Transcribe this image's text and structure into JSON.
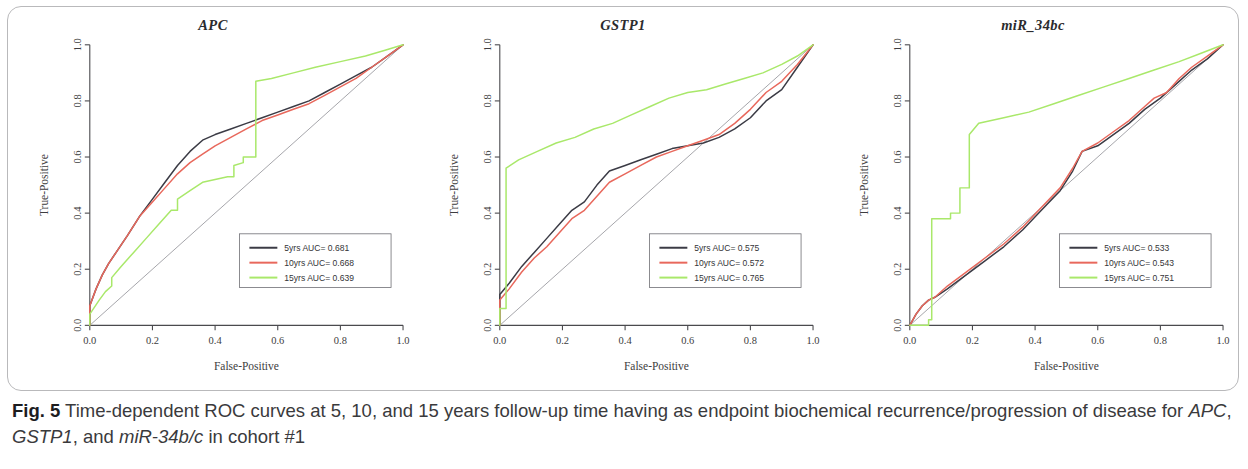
{
  "figure": {
    "caption_label": "Fig. 5",
    "caption_part1": " Time-dependent ROC curves at 5, 10, and 15 years follow-up time having as endpoint biochemical recurrence/progression of disease for ",
    "caption_italic1": "APC",
    "caption_sep1": ", ",
    "caption_italic2": "GSTP1",
    "caption_sep2": ", and ",
    "caption_italic3": "miR-34b/c",
    "caption_part_end": " in cohort #1"
  },
  "axes": {
    "xlabel": "False-Positive",
    "ylabel": "True-Positive",
    "xticks": [
      "0.0",
      "0.2",
      "0.4",
      "0.6",
      "0.8",
      "1.0"
    ],
    "yticks": [
      "0.0",
      "0.2",
      "0.4",
      "0.6",
      "0.8",
      "1.0"
    ]
  },
  "colors": {
    "curve_5yrs": "#3b3b45",
    "curve_10yrs": "#e8685c",
    "curve_15yrs": "#a9e86a",
    "reference_line": "#8f8f96",
    "axis": "#4a4a4e",
    "frame_border": "#b9b9bb"
  },
  "chart_data": [
    {
      "type": "line",
      "title": "APC",
      "xlabel": "False-Positive",
      "ylabel": "True-Positive",
      "xlim": [
        0,
        1
      ],
      "ylim": [
        0,
        1
      ],
      "grid": false,
      "legend_position": "bottom-right",
      "reference_line": "diagonal y=x",
      "series": [
        {
          "name": "5yrs",
          "legend_label": "5yrs  AUC= 0.681",
          "auc": 0.681,
          "color": "#3b3b45",
          "x": [
            0.0,
            0.0,
            0.02,
            0.04,
            0.06,
            0.09,
            0.12,
            0.16,
            0.2,
            0.24,
            0.28,
            0.32,
            0.36,
            0.4,
            0.45,
            0.5,
            0.55,
            0.6,
            0.65,
            0.7,
            0.75,
            0.8,
            0.85,
            0.9,
            0.95,
            1.0
          ],
          "y": [
            0.0,
            0.07,
            0.13,
            0.18,
            0.22,
            0.27,
            0.32,
            0.39,
            0.45,
            0.51,
            0.57,
            0.62,
            0.66,
            0.68,
            0.7,
            0.72,
            0.74,
            0.76,
            0.78,
            0.8,
            0.83,
            0.86,
            0.89,
            0.92,
            0.96,
            1.0
          ]
        },
        {
          "name": "10yrs",
          "legend_label": "10yrs  AUC= 0.668",
          "auc": 0.668,
          "color": "#e8685c",
          "x": [
            0.0,
            0.0,
            0.02,
            0.04,
            0.06,
            0.09,
            0.12,
            0.16,
            0.2,
            0.24,
            0.28,
            0.32,
            0.36,
            0.4,
            0.45,
            0.5,
            0.55,
            0.6,
            0.65,
            0.7,
            0.75,
            0.8,
            0.85,
            0.9,
            0.95,
            1.0
          ],
          "y": [
            0.0,
            0.07,
            0.13,
            0.18,
            0.22,
            0.27,
            0.32,
            0.39,
            0.44,
            0.49,
            0.54,
            0.58,
            0.61,
            0.64,
            0.67,
            0.7,
            0.73,
            0.75,
            0.77,
            0.79,
            0.82,
            0.85,
            0.88,
            0.92,
            0.96,
            1.0
          ]
        },
        {
          "name": "15yrs",
          "legend_label": "15yrs  AUC= 0.639",
          "auc": 0.639,
          "color": "#a9e86a",
          "x": [
            0.0,
            0.0,
            0.03,
            0.05,
            0.07,
            0.07,
            0.1,
            0.14,
            0.18,
            0.22,
            0.26,
            0.28,
            0.28,
            0.32,
            0.36,
            0.4,
            0.44,
            0.46,
            0.46,
            0.49,
            0.49,
            0.53,
            0.53,
            0.58,
            0.65,
            0.72,
            0.8,
            0.88,
            0.94,
            1.0
          ],
          "y": [
            0.0,
            0.04,
            0.09,
            0.12,
            0.14,
            0.17,
            0.21,
            0.26,
            0.31,
            0.36,
            0.41,
            0.41,
            0.45,
            0.48,
            0.51,
            0.52,
            0.53,
            0.53,
            0.57,
            0.58,
            0.6,
            0.6,
            0.87,
            0.88,
            0.9,
            0.92,
            0.94,
            0.96,
            0.98,
            1.0
          ]
        }
      ]
    },
    {
      "type": "line",
      "title": "GSTP1",
      "xlabel": "False-Positive",
      "ylabel": "True-Positive",
      "xlim": [
        0,
        1
      ],
      "ylim": [
        0,
        1
      ],
      "grid": false,
      "legend_position": "bottom-right",
      "reference_line": "diagonal y=x",
      "series": [
        {
          "name": "5yrs",
          "legend_label": "5yrs  AUC= 0.575",
          "auc": 0.575,
          "color": "#3b3b45",
          "x": [
            0.0,
            0.0,
            0.03,
            0.07,
            0.11,
            0.15,
            0.19,
            0.23,
            0.27,
            0.31,
            0.35,
            0.4,
            0.45,
            0.5,
            0.55,
            0.6,
            0.65,
            0.7,
            0.75,
            0.8,
            0.85,
            0.9,
            0.95,
            1.0
          ],
          "y": [
            0.0,
            0.11,
            0.15,
            0.21,
            0.26,
            0.31,
            0.36,
            0.41,
            0.44,
            0.5,
            0.55,
            0.57,
            0.59,
            0.61,
            0.63,
            0.64,
            0.65,
            0.67,
            0.7,
            0.74,
            0.8,
            0.84,
            0.92,
            1.0
          ]
        },
        {
          "name": "10yrs",
          "legend_label": "10yrs  AUC= 0.572",
          "auc": 0.572,
          "color": "#e8685c",
          "x": [
            0.0,
            0.0,
            0.03,
            0.07,
            0.11,
            0.15,
            0.19,
            0.23,
            0.27,
            0.31,
            0.35,
            0.4,
            0.45,
            0.5,
            0.55,
            0.6,
            0.65,
            0.7,
            0.75,
            0.8,
            0.85,
            0.9,
            0.95,
            1.0
          ],
          "y": [
            0.0,
            0.09,
            0.13,
            0.19,
            0.24,
            0.28,
            0.33,
            0.38,
            0.41,
            0.46,
            0.51,
            0.54,
            0.57,
            0.6,
            0.62,
            0.64,
            0.66,
            0.68,
            0.72,
            0.77,
            0.83,
            0.87,
            0.93,
            1.0
          ]
        },
        {
          "name": "15yrs",
          "legend_label": "15yrs  AUC= 0.765",
          "auc": 0.765,
          "color": "#a9e86a",
          "x": [
            0.0,
            0.0,
            0.02,
            0.02,
            0.06,
            0.12,
            0.18,
            0.24,
            0.3,
            0.36,
            0.42,
            0.48,
            0.54,
            0.6,
            0.66,
            0.72,
            0.78,
            0.84,
            0.9,
            0.95,
            1.0
          ],
          "y": [
            0.0,
            0.06,
            0.06,
            0.56,
            0.59,
            0.62,
            0.65,
            0.67,
            0.7,
            0.72,
            0.75,
            0.78,
            0.81,
            0.83,
            0.84,
            0.86,
            0.88,
            0.9,
            0.93,
            0.96,
            1.0
          ]
        }
      ]
    },
    {
      "type": "line",
      "title": "miR_34bc",
      "xlabel": "False-Positive",
      "ylabel": "True-Positive",
      "xlim": [
        0,
        1
      ],
      "ylim": [
        0,
        1
      ],
      "grid": false,
      "legend_position": "bottom-right",
      "reference_line": "diagonal y=x",
      "series": [
        {
          "name": "5yrs",
          "legend_label": "5yrs  AUC= 0.533",
          "auc": 0.533,
          "color": "#3b3b45",
          "x": [
            0.0,
            0.02,
            0.04,
            0.06,
            0.08,
            0.12,
            0.18,
            0.24,
            0.3,
            0.36,
            0.42,
            0.48,
            0.52,
            0.55,
            0.6,
            0.65,
            0.7,
            0.75,
            0.8,
            0.85,
            0.9,
            0.95,
            1.0
          ],
          "y": [
            0.0,
            0.04,
            0.07,
            0.09,
            0.1,
            0.13,
            0.18,
            0.23,
            0.28,
            0.34,
            0.41,
            0.48,
            0.55,
            0.62,
            0.64,
            0.68,
            0.72,
            0.77,
            0.81,
            0.86,
            0.91,
            0.95,
            1.0
          ]
        },
        {
          "name": "10yrs",
          "legend_label": "10yrs  AUC= 0.543",
          "auc": 0.543,
          "color": "#e8685c",
          "x": [
            0.0,
            0.02,
            0.04,
            0.06,
            0.08,
            0.12,
            0.18,
            0.24,
            0.3,
            0.36,
            0.42,
            0.48,
            0.52,
            0.55,
            0.6,
            0.65,
            0.7,
            0.75,
            0.78,
            0.82,
            0.86,
            0.9,
            0.95,
            1.0
          ],
          "y": [
            0.0,
            0.04,
            0.07,
            0.09,
            0.1,
            0.14,
            0.19,
            0.24,
            0.29,
            0.35,
            0.42,
            0.49,
            0.56,
            0.62,
            0.65,
            0.69,
            0.73,
            0.78,
            0.81,
            0.83,
            0.88,
            0.92,
            0.96,
            1.0
          ]
        },
        {
          "name": "15yrs",
          "legend_label": "15yrs  AUC= 0.751",
          "auc": 0.751,
          "color": "#a9e86a",
          "x": [
            0.0,
            0.06,
            0.06,
            0.07,
            0.07,
            0.13,
            0.13,
            0.16,
            0.16,
            0.19,
            0.19,
            0.22,
            0.3,
            0.38,
            0.46,
            0.54,
            0.62,
            0.7,
            0.78,
            0.86,
            0.93,
            1.0
          ],
          "y": [
            0.0,
            0.0,
            0.02,
            0.02,
            0.38,
            0.38,
            0.4,
            0.4,
            0.49,
            0.49,
            0.68,
            0.72,
            0.74,
            0.76,
            0.79,
            0.82,
            0.85,
            0.88,
            0.91,
            0.94,
            0.97,
            1.0
          ]
        }
      ]
    }
  ]
}
